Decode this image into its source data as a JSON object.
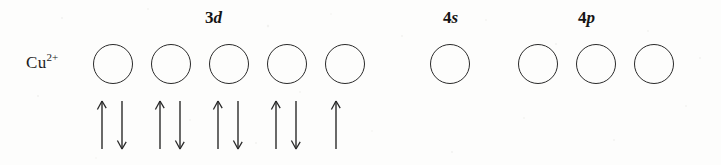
{
  "figure": {
    "type": "orbital-box-diagram",
    "species_label": "Cu",
    "species_charge": "2+",
    "background_color": "#fdfdfc",
    "ink_color": "#2a2a2a"
  },
  "subshells": [
    {
      "key": "3d",
      "label_n": "3",
      "label_l": "d",
      "label_x": 205,
      "label_y": 8,
      "orbital_count": 5,
      "first_orbital_x": 93,
      "orbital_pitch": 58,
      "orbital_y": 44,
      "orbital_diameter": 40,
      "electrons_per_orbital": [
        2,
        2,
        2,
        2,
        1
      ],
      "spins": [
        [
          "up",
          "down"
        ],
        [
          "up",
          "down"
        ],
        [
          "up",
          "down"
        ],
        [
          "up",
          "down"
        ],
        [
          "up"
        ]
      ],
      "arrows_y": 100
    },
    {
      "key": "4s",
      "label_n": "4",
      "label_l": "s",
      "label_x": 443,
      "label_y": 8,
      "orbital_count": 1,
      "first_orbital_x": 430,
      "orbital_pitch": 58,
      "orbital_y": 44,
      "orbital_diameter": 40,
      "electrons_per_orbital": [
        0
      ],
      "spins": [
        []
      ],
      "arrows_y": 100
    },
    {
      "key": "4p",
      "label_n": "4",
      "label_l": "p",
      "label_x": 578,
      "label_y": 8,
      "orbital_count": 3,
      "first_orbital_x": 518,
      "orbital_pitch": 58,
      "orbital_y": 44,
      "orbital_diameter": 40,
      "electrons_per_orbital": [
        0,
        0,
        0
      ],
      "spins": [
        [],
        [],
        []
      ],
      "arrows_y": 100
    }
  ]
}
